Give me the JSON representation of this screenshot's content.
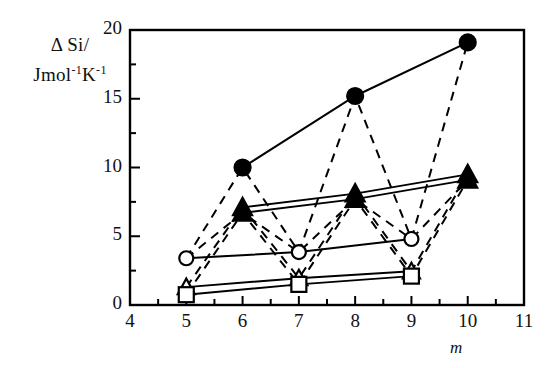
{
  "chart_data": {
    "type": "scatter",
    "title": "",
    "subtitle": "",
    "xlabel": "m",
    "ylabel": "Δ Si/ Jmol⁻¹K⁻¹",
    "ylabel_line1": "Δ Si/",
    "ylabel_line2_prefix": "Jmol",
    "ylabel_line2_sup1": "-1",
    "ylabel_line2_mid": "K",
    "ylabel_line2_sup2": "-1",
    "xlim": [
      4,
      11
    ],
    "ylim": [
      0,
      20
    ],
    "x_ticks": [
      4,
      5,
      6,
      7,
      8,
      9,
      10,
      11
    ],
    "x_tick_labels": [
      "4",
      "5",
      "6",
      "7",
      "8",
      "9",
      "10",
      "11"
    ],
    "x_minor_step": 0.5,
    "y_ticks": [
      0,
      5,
      10,
      15,
      20
    ],
    "y_tick_labels": [
      "0",
      "5",
      "10",
      "15",
      "20"
    ],
    "y_minor_step": 2.5,
    "grid": false,
    "legend": "none",
    "frame": "box",
    "line_color": "#000000",
    "marker_fill_solid": "#000000",
    "marker_fill_open": "#ffffff",
    "series": [
      {
        "name": "filled-circle-series",
        "marker": "circle-filled",
        "linestyle": "solid",
        "x": [
          6,
          8,
          10
        ],
        "values": [
          10.0,
          15.2,
          19.1
        ]
      },
      {
        "name": "filled-triangle-series-upper",
        "marker": "triangle-filled",
        "linestyle": "solid",
        "x": [
          6,
          8,
          10
        ],
        "values": [
          7.1,
          8.1,
          9.5
        ]
      },
      {
        "name": "filled-triangle-series-lower",
        "marker": "triangle-filled",
        "linestyle": "solid",
        "x": [
          6,
          8,
          10
        ],
        "values": [
          6.7,
          7.7,
          9.1
        ]
      },
      {
        "name": "open-circle-series",
        "marker": "circle-open",
        "linestyle": "solid",
        "x": [
          5,
          7,
          9
        ],
        "values": [
          3.4,
          3.85,
          4.8
        ]
      },
      {
        "name": "open-triangle-series",
        "marker": "triangle-open",
        "linestyle": "solid",
        "x": [
          5,
          7,
          9
        ],
        "values": [
          1.3,
          1.95,
          2.45
        ]
      },
      {
        "name": "open-square-series",
        "marker": "square-open",
        "linestyle": "solid",
        "x": [
          5,
          7,
          9
        ],
        "values": [
          0.75,
          1.5,
          2.1
        ]
      }
    ],
    "dashed_connectors": [
      {
        "name": "circle-zigzag-1",
        "points": [
          [
            5,
            3.4
          ],
          [
            6,
            10.0
          ],
          [
            7,
            3.85
          ],
          [
            8,
            15.2
          ],
          [
            9,
            4.8
          ],
          [
            10,
            19.1
          ]
        ]
      },
      {
        "name": "triangle-upper-zigzag",
        "points": [
          [
            5,
            1.3
          ],
          [
            6,
            7.1
          ],
          [
            7,
            1.95
          ],
          [
            8,
            8.1
          ],
          [
            9,
            2.45
          ],
          [
            10,
            9.5
          ]
        ]
      },
      {
        "name": "triangle-lower-zigzag",
        "points": [
          [
            5,
            0.75
          ],
          [
            6,
            6.7
          ],
          [
            7,
            1.5
          ],
          [
            8,
            7.7
          ],
          [
            9,
            2.1
          ],
          [
            10,
            9.1
          ]
        ]
      },
      {
        "name": "circle-open-to-filled-tri",
        "points": [
          [
            5,
            3.4
          ],
          [
            6,
            6.7
          ],
          [
            7,
            3.85
          ],
          [
            8,
            7.7
          ],
          [
            9,
            4.8
          ],
          [
            10,
            9.1
          ]
        ]
      }
    ]
  }
}
